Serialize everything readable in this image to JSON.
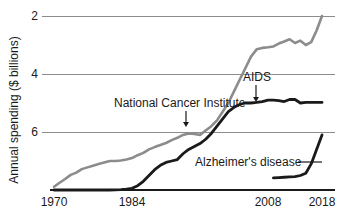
{
  "chart_data": {
    "type": "line",
    "title": "",
    "subtitle": "",
    "xlabel": "",
    "ylabel": "Annual spending ($ billions)",
    "xlim": [
      1970,
      2018
    ],
    "ylim": [
      0,
      6
    ],
    "xticks": [
      1970,
      1984,
      2008,
      2018
    ],
    "xtick_labels": [
      "1970",
      "1984",
      "2008",
      "2018"
    ],
    "yticks": [
      2,
      4,
      6
    ],
    "ytick_labels": [
      "2",
      "4",
      "6"
    ],
    "grid": "horizontal",
    "legend": "none",
    "colors": {
      "national_cancer_institute": "#8c8c8c",
      "aids": "#1a1a1a",
      "alzheimers": "#1a1a1a",
      "gridline": "#8c8c8c",
      "axis": "#1a1a1a",
      "text": "#1a1a1a",
      "background": "#ffffff"
    },
    "series": [
      {
        "name": "National Cancer Institute",
        "color": "#8c8c8c",
        "width": 2.6,
        "x": [
          1970,
          1971,
          1972,
          1973,
          1974,
          1975,
          1976,
          1977,
          1978,
          1979,
          1980,
          1981,
          1982,
          1983,
          1984,
          1985,
          1986,
          1987,
          1988,
          1989,
          1990,
          1991,
          1992,
          1993,
          1994,
          1995,
          1996,
          1997,
          1998,
          1999,
          2000,
          2001,
          2002,
          2003,
          2004,
          2005,
          2006,
          2007,
          2008,
          2009,
          2010,
          2011,
          2012,
          2013,
          2014,
          2015,
          2016,
          2017,
          2018
        ],
        "values": [
          0.11,
          0.25,
          0.38,
          0.52,
          0.6,
          0.72,
          0.78,
          0.84,
          0.9,
          0.95,
          1.0,
          1.0,
          1.02,
          1.05,
          1.1,
          1.2,
          1.28,
          1.4,
          1.48,
          1.55,
          1.62,
          1.72,
          1.8,
          1.9,
          1.95,
          1.93,
          1.9,
          2.05,
          2.2,
          2.4,
          2.7,
          3.0,
          3.4,
          3.8,
          4.2,
          4.6,
          4.85,
          4.9,
          4.92,
          4.95,
          5.05,
          5.12,
          5.2,
          5.07,
          5.15,
          5.0,
          5.1,
          5.5,
          6.0
        ]
      },
      {
        "name": "AIDS",
        "color": "#1a1a1a",
        "width": 2.8,
        "x": [
          1970,
          1980,
          1982,
          1983,
          1984,
          1985,
          1986,
          1987,
          1988,
          1989,
          1990,
          1991,
          1992,
          1993,
          1994,
          1995,
          1996,
          1997,
          1998,
          1999,
          2000,
          2001,
          2002,
          2003,
          2004,
          2005,
          2006,
          2007,
          2008,
          2009,
          2010,
          2011,
          2012,
          2013,
          2014,
          2015,
          2016,
          2017,
          2018
        ],
        "values": [
          0.0,
          0.0,
          0.01,
          0.03,
          0.06,
          0.15,
          0.3,
          0.5,
          0.7,
          0.85,
          0.95,
          1.0,
          1.05,
          1.25,
          1.4,
          1.5,
          1.6,
          1.75,
          1.95,
          2.2,
          2.45,
          2.7,
          2.85,
          2.95,
          3.0,
          3.0,
          3.02,
          3.05,
          3.1,
          3.1,
          3.08,
          3.05,
          3.12,
          3.12,
          3.0,
          3.02,
          3.02,
          3.02,
          3.02
        ]
      },
      {
        "name": "Alzheimer's disease",
        "color": "#1a1a1a",
        "width": 2.8,
        "x": [
          2009,
          2010,
          2011,
          2012,
          2013,
          2014,
          2015,
          2016,
          2017,
          2018
        ],
        "values": [
          0.42,
          0.43,
          0.44,
          0.45,
          0.46,
          0.5,
          0.58,
          0.9,
          1.4,
          1.9
        ]
      }
    ],
    "annotations": [
      {
        "id": "nci-annotation",
        "text": "National Cancer Institute",
        "text_x": 114,
        "text_y": 107,
        "anchor": "start",
        "leader": "arrow-down",
        "arrow_from_x": 186,
        "arrow_from_y": 111,
        "arrow_to_x": 186,
        "arrow_to_y": 127
      },
      {
        "id": "aids-annotation",
        "text": "AIDS",
        "text_x": 243,
        "text_y": 81,
        "anchor": "start",
        "leader": "arrow-down",
        "arrow_from_x": 256,
        "arrow_from_y": 85,
        "arrow_to_x": 256,
        "arrow_to_y": 102
      },
      {
        "id": "alzheimers-annotation",
        "text": "Alzheimer's disease",
        "text_x": 195,
        "text_y": 166,
        "anchor": "start",
        "leader": "line-right",
        "arrow_from_x": 298,
        "arrow_from_y": 162,
        "arrow_to_x": 322,
        "arrow_to_y": 162
      }
    ]
  },
  "geometry": {
    "plot_left": 50,
    "plot_right": 335,
    "plot_top": 16,
    "plot_bottom": 190,
    "y_value_top": 6,
    "y_value_bottom": 0,
    "x_ticks_px": [
      54,
      132,
      268,
      322
    ],
    "gridline_y_px": [
      16,
      74,
      132
    ],
    "ylabel_x": 18,
    "ylabel_y": 110
  }
}
